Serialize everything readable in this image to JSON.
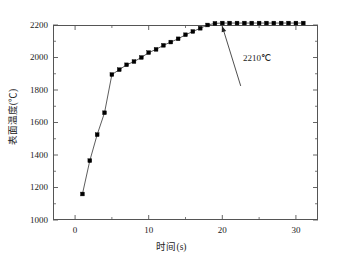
{
  "chart_data": {
    "type": "line",
    "title": "",
    "subtitle": "",
    "xlabel": "时间(s)",
    "ylabel": "表面温度(℃)",
    "xlim": [
      -3,
      33
    ],
    "ylim": [
      1000,
      2200
    ],
    "xticks": [
      0,
      10,
      20,
      30
    ],
    "xtick_labels": [
      "0",
      "10",
      "20",
      "30"
    ],
    "xminor_step": 5,
    "yticks": [
      1000,
      1200,
      1400,
      1600,
      1800,
      2000,
      2200
    ],
    "ytick_labels": [
      "1000",
      "1200",
      "1400",
      "1600",
      "1800",
      "2000",
      "2200"
    ],
    "yminor_step": 100,
    "grid": false,
    "legend": null,
    "marker": "square",
    "marker_color": "#000000",
    "line_color": "#333333",
    "series": [
      {
        "name": "表面温度",
        "x": [
          1,
          2,
          3,
          4,
          5,
          6,
          7,
          8,
          9,
          10,
          11,
          12,
          13,
          14,
          15,
          16,
          17,
          18,
          19,
          20,
          21,
          22,
          23,
          24,
          25,
          26,
          27,
          28,
          29,
          30,
          31
        ],
        "values": [
          1160,
          1365,
          1525,
          1660,
          1895,
          1925,
          1955,
          1975,
          2000,
          2030,
          2050,
          2075,
          2095,
          2115,
          2140,
          2160,
          2180,
          2200,
          2210,
          2212,
          2212,
          2212,
          2212,
          2212,
          2212,
          2212,
          2212,
          2212,
          2212,
          2212,
          2212
        ]
      }
    ],
    "annotations": [
      {
        "text": "2210℃",
        "x": 20,
        "y": 2210,
        "label_x": 22.5,
        "label_y": 1825,
        "arrow": true
      }
    ]
  },
  "axis": {
    "x_title": "时间(s)",
    "y_title": "表面温度(℃)"
  },
  "colors": {
    "frame": "#555555",
    "marker": "#000000",
    "line": "#333333",
    "text": "#222222",
    "background": "#ffffff"
  }
}
